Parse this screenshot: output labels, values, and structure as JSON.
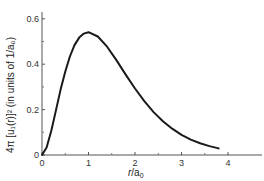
{
  "chart_data": {
    "type": "line",
    "title": "",
    "xlabel": "r/a0",
    "ylabel": "4π [u1(r)]² (in units of 1/a0)",
    "xlim": [
      0,
      4.5
    ],
    "ylim": [
      0,
      0.65
    ],
    "grid": false,
    "legend": null,
    "x_ticks": [
      0,
      1,
      2,
      3,
      4
    ],
    "x_tick_labels": [
      "0",
      "1",
      "2",
      "3",
      "4"
    ],
    "x_minor_ticks": [
      0.5,
      1.5,
      2.5,
      3.5
    ],
    "y_ticks": [
      0,
      0.2,
      0.4,
      0.6
    ],
    "y_tick_labels": [
      "0",
      "0.2",
      "0.4",
      "0.6"
    ],
    "y_minor_ticks": [
      0.1,
      0.3,
      0.5
    ],
    "series": [
      {
        "name": "4π[u1(r)]²",
        "color": "#1a1a1a",
        "x": [
          0,
          0.1,
          0.2,
          0.3,
          0.4,
          0.5,
          0.6,
          0.7,
          0.8,
          0.9,
          1.0,
          1.2,
          1.4,
          1.6,
          1.8,
          2.0,
          2.2,
          2.4,
          2.6,
          2.8,
          3.0,
          3.2,
          3.4,
          3.6,
          3.8
        ],
        "y": [
          0,
          0.033,
          0.107,
          0.198,
          0.288,
          0.368,
          0.434,
          0.484,
          0.517,
          0.535,
          0.541,
          0.522,
          0.477,
          0.418,
          0.354,
          0.293,
          0.237,
          0.189,
          0.149,
          0.116,
          0.089,
          0.068,
          0.052,
          0.039,
          0.029
        ]
      }
    ]
  },
  "axes": {
    "x_label_main": "r",
    "x_label_sep": "/a",
    "x_label_sub": "0",
    "y_label": "4π [u₁(r)]² (in units of 1/a₀)"
  }
}
